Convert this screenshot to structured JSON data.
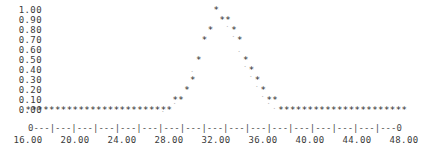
{
  "chart_data": {
    "type": "scatter",
    "title": "",
    "subtitle": "",
    "xlabel": "",
    "ylabel": "",
    "style": "ascii-character-plot",
    "marker": "*",
    "grid": false,
    "legend": null,
    "xlim": [
      16.0,
      48.0
    ],
    "ylim": [
      0.0,
      1.0
    ],
    "ytick_labels": [
      "1.00",
      "0.90",
      "0.80",
      "0.70",
      "0.60",
      "0.50",
      "0.40",
      "0.30",
      "0.20",
      "0.10",
      "0.00"
    ],
    "ytick_values": [
      1.0,
      0.9,
      0.8,
      0.7,
      0.6,
      0.5,
      0.4,
      0.3,
      0.2,
      0.1,
      0.0
    ],
    "xtick_labels": [
      "16.00",
      "20.00",
      "24.00",
      "28.00",
      "32.00",
      "36.00",
      "40.00",
      "44.00",
      "48.00"
    ],
    "xtick_values": [
      16.0,
      20.0,
      24.0,
      28.0,
      32.0,
      36.0,
      40.0,
      44.0,
      48.0
    ],
    "axis_line": "0---|---|---|---|---|---|---|---|---|---|---|---|---|---|---|---|---0",
    "series": [
      {
        "name": "primary",
        "marker": "*",
        "x": [
          16.0,
          16.5,
          17.0,
          17.5,
          18.0,
          18.5,
          19.0,
          19.5,
          20.0,
          20.5,
          21.0,
          21.5,
          22.0,
          22.5,
          23.0,
          23.5,
          24.0,
          24.5,
          25.0,
          25.5,
          26.0,
          26.5,
          27.0,
          27.5,
          28.0,
          28.5,
          29.0,
          29.5,
          30.0,
          30.5,
          31.0,
          31.5,
          32.0,
          32.5,
          33.0,
          33.5,
          34.0,
          34.5,
          35.0,
          35.5,
          36.0,
          36.5,
          37.0,
          37.5,
          38.0,
          38.5,
          39.0,
          39.5,
          40.0,
          40.5,
          41.0,
          41.5,
          42.0,
          42.5,
          43.0,
          43.5,
          44.0,
          44.5,
          45.0,
          45.5,
          46.0,
          46.5,
          47.0,
          47.5,
          48.0
        ],
        "y": [
          0.0,
          0.0,
          0.0,
          0.0,
          0.0,
          0.0,
          0.0,
          0.0,
          0.0,
          0.0,
          0.0,
          0.0,
          0.0,
          0.0,
          0.0,
          0.0,
          0.0,
          0.0,
          0.0,
          0.0,
          0.0,
          0.0,
          0.0,
          0.0,
          0.0,
          0.1,
          0.1,
          0.2,
          0.3,
          0.5,
          0.7,
          0.8,
          1.0,
          0.9,
          0.9,
          0.8,
          0.7,
          0.5,
          0.4,
          0.3,
          0.2,
          0.1,
          0.1,
          0.0,
          0.0,
          0.0,
          0.0,
          0.0,
          0.0,
          0.0,
          0.0,
          0.0,
          0.0,
          0.0,
          0.0,
          0.0,
          0.0,
          0.0,
          0.0,
          0.0,
          0.0,
          0.0,
          0.0,
          0.0,
          0.0
        ]
      },
      {
        "name": "secondary",
        "marker": ".",
        "x": [
          27.5,
          28.0,
          28.5,
          29.0,
          29.5,
          30.0,
          30.5,
          31.0,
          31.5,
          32.5,
          33.0,
          33.5,
          34.0,
          34.5,
          35.0,
          35.5,
          36.0,
          36.5,
          37.0
        ],
        "y": [
          0.0,
          0.05,
          0.08,
          0.15,
          0.25,
          0.4,
          0.55,
          0.75,
          0.85,
          0.95,
          0.85,
          0.75,
          0.6,
          0.45,
          0.35,
          0.25,
          0.15,
          0.08,
          0.03
        ]
      }
    ]
  }
}
